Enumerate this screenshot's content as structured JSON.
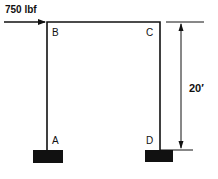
{
  "diagram": {
    "type": "portal-frame",
    "load": {
      "label": "750 lbf",
      "direction": "right",
      "applied_at": "B"
    },
    "nodes": [
      {
        "id": "A",
        "label": "A",
        "role": "fixed-support"
      },
      {
        "id": "B",
        "label": "B",
        "role": "top-left-corner"
      },
      {
        "id": "C",
        "label": "C",
        "role": "top-right-corner"
      },
      {
        "id": "D",
        "label": "D",
        "role": "fixed-support"
      }
    ],
    "dimension": {
      "label": "20′",
      "measures": "height"
    },
    "colors": {
      "line": "#111111",
      "support": "#111111",
      "background": "#ffffff"
    }
  }
}
